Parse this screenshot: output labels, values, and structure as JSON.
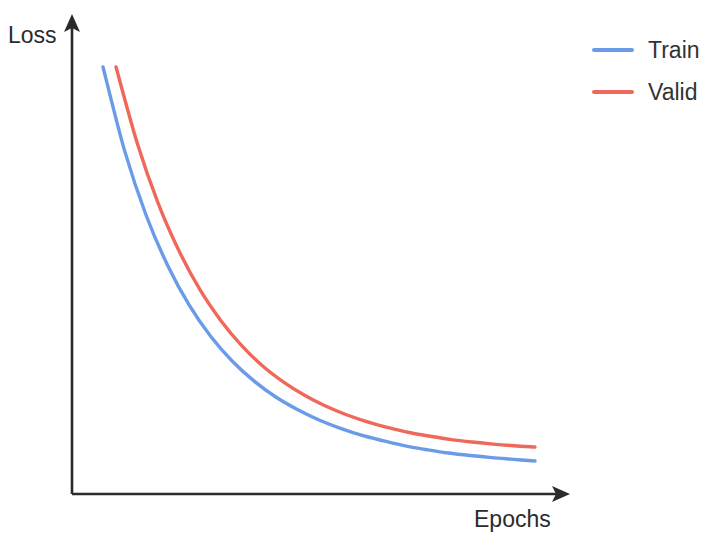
{
  "figure": {
    "width": 706,
    "height": 537,
    "background": "#ffffff"
  },
  "axes": {
    "y_label": "Loss",
    "x_label": "Epochs",
    "axis_color": "#2b2b2b",
    "origin": [
      72,
      494
    ],
    "y_arrow_tip": [
      72,
      16
    ],
    "x_arrow_tip": [
      568,
      494
    ]
  },
  "legend": {
    "position": "top-right",
    "entries": [
      {
        "label": "Train",
        "color": "#6a9be8"
      },
      {
        "label": "Valid",
        "color": "#f0685a"
      }
    ]
  },
  "chart_data": {
    "type": "line",
    "title": "",
    "subtitle": "",
    "xlabel": "Epochs",
    "ylabel": "Loss",
    "xlim": [
      0,
      1
    ],
    "ylim": [
      0,
      1
    ],
    "grid": false,
    "legend_position": "top-right",
    "annotations": [],
    "x_tick_labels": [],
    "y_tick_labels": [],
    "note": "Schematic hand-drawn style exponential decay; axes are unlabeled/unscaled. Values below are normalized 0-1 where x=0 is the curve start and y is relative loss.",
    "x": [
      0.0,
      0.05,
      0.1,
      0.15,
      0.2,
      0.25,
      0.3,
      0.35,
      0.4,
      0.45,
      0.5,
      0.55,
      0.6,
      0.65,
      0.7,
      0.75,
      0.8,
      0.85,
      0.9,
      0.95,
      1.0
    ],
    "series": [
      {
        "name": "Train",
        "color": "#6a9be8",
        "values": [
          1.0,
          0.8,
          0.645,
          0.525,
          0.43,
          0.355,
          0.296,
          0.249,
          0.211,
          0.181,
          0.156,
          0.136,
          0.119,
          0.106,
          0.094,
          0.085,
          0.077,
          0.071,
          0.066,
          0.062,
          0.058
        ],
        "pixel_start": [
          103,
          67
        ],
        "pixel_end": [
          535,
          461
        ]
      },
      {
        "name": "Valid",
        "color": "#f0685a",
        "values": [
          1.0,
          0.818,
          0.672,
          0.556,
          0.462,
          0.387,
          0.326,
          0.277,
          0.238,
          0.206,
          0.18,
          0.159,
          0.142,
          0.128,
          0.116,
          0.107,
          0.099,
          0.093,
          0.088,
          0.084,
          0.081
        ],
        "pixel_start": [
          116,
          67
        ],
        "pixel_end": [
          535,
          447
        ]
      }
    ]
  }
}
